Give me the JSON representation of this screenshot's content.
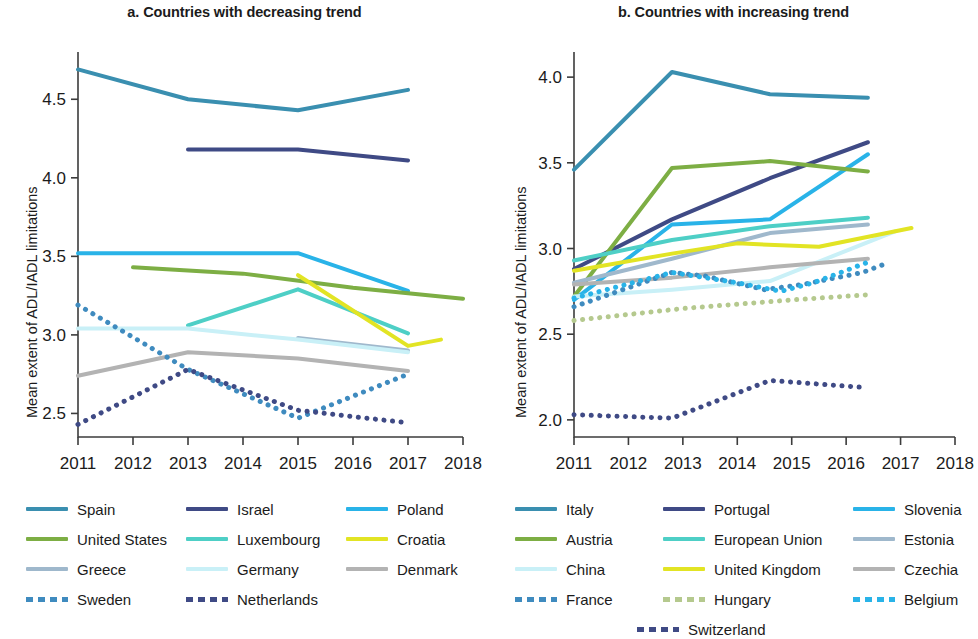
{
  "figure": {
    "ylabel": "Mean extent of ADL/IADL limitations"
  },
  "panels": [
    {
      "id": "a",
      "title": "a. Countries with decreasing trend",
      "xticks": [
        "2011",
        "2012",
        "2013",
        "2014",
        "2015",
        "2016",
        "2017",
        "2018"
      ],
      "yticks": [
        "2.5",
        "3.0",
        "3.5",
        "4.0",
        "4.5"
      ],
      "legend": [
        {
          "label": "Spain",
          "color": "#3a8fb0",
          "style": "solid"
        },
        {
          "label": "Israel",
          "color": "#3f4a85",
          "style": "solid"
        },
        {
          "label": "Poland",
          "color": "#29b3e8",
          "style": "solid"
        },
        {
          "label": "United States",
          "color": "#7dae44",
          "style": "solid"
        },
        {
          "label": "Luxembourg",
          "color": "#4ecfc6",
          "style": "solid"
        },
        {
          "label": "Croatia",
          "color": "#e2e424",
          "style": "solid"
        },
        {
          "label": "Greece",
          "color": "#9fb8cc",
          "style": "solid"
        },
        {
          "label": "Germany",
          "color": "#c9f0f7",
          "style": "solid"
        },
        {
          "label": "Denmark",
          "color": "#b3b3b3",
          "style": "solid"
        },
        {
          "label": "Sweden",
          "color": "#3f8bbf",
          "style": "dotted"
        },
        {
          "label": "Netherlands",
          "color": "#3f4a85",
          "style": "dotted"
        }
      ]
    },
    {
      "id": "b",
      "title": "b. Countries with increasing trend",
      "xticks": [
        "2011",
        "2012",
        "2013",
        "2014",
        "2015",
        "2016",
        "2017",
        "2018"
      ],
      "yticks": [
        "2.0",
        "2.5",
        "3.0",
        "3.5",
        "4.0"
      ],
      "legend": [
        {
          "label": "Italy",
          "color": "#3a8fb0",
          "style": "solid"
        },
        {
          "label": "Portugal",
          "color": "#3f4a85",
          "style": "solid"
        },
        {
          "label": "Slovenia",
          "color": "#29b3e8",
          "style": "solid"
        },
        {
          "label": "Austria",
          "color": "#7dae44",
          "style": "solid"
        },
        {
          "label": "European Union",
          "color": "#4ecfc6",
          "style": "solid"
        },
        {
          "label": "Estonia",
          "color": "#9fb8cc",
          "style": "solid"
        },
        {
          "label": "China",
          "color": "#c9f0f7",
          "style": "solid"
        },
        {
          "label": "United Kingdom",
          "color": "#e2e424",
          "style": "solid"
        },
        {
          "label": "Czechia",
          "color": "#b3b3b3",
          "style": "solid"
        },
        {
          "label": "France",
          "color": "#3f8bbf",
          "style": "dotted"
        },
        {
          "label": "Hungary",
          "color": "#b5c98e",
          "style": "dotted"
        },
        {
          "label": "Belgium",
          "color": "#29b3e8",
          "style": "dotted"
        },
        {
          "label": "Switzerland",
          "color": "#3f4a85",
          "style": "dotted"
        }
      ]
    }
  ],
  "chart_data": [
    {
      "type": "line",
      "title": "a. Countries with decreasing trend",
      "xlabel": "",
      "ylabel": "Mean extent of ADL/IADL limitations",
      "xlim": [
        2011,
        2018
      ],
      "ylim": [
        2.35,
        4.75
      ],
      "yticks": [
        2.5,
        3.0,
        3.5,
        4.0,
        4.5
      ],
      "xticks": [
        2011,
        2012,
        2013,
        2014,
        2015,
        2016,
        2017,
        2018
      ],
      "grid": false,
      "legend_position": "below",
      "series": [
        {
          "name": "Spain",
          "color": "#3a8fb0",
          "style": "solid",
          "points": [
            [
              2011,
              4.69
            ],
            [
              2013,
              4.5
            ],
            [
              2015,
              4.43
            ],
            [
              2017,
              4.56
            ]
          ]
        },
        {
          "name": "Israel",
          "color": "#3f4a85",
          "style": "solid",
          "points": [
            [
              2013,
              4.18
            ],
            [
              2015,
              4.18
            ],
            [
              2017,
              4.11
            ]
          ]
        },
        {
          "name": "Poland",
          "color": "#29b3e8",
          "style": "solid",
          "points": [
            [
              2011,
              3.52
            ],
            [
              2015,
              3.52
            ],
            [
              2017,
              3.28
            ]
          ]
        },
        {
          "name": "United States",
          "color": "#7dae44",
          "style": "solid",
          "points": [
            [
              2012,
              3.43
            ],
            [
              2014,
              3.39
            ],
            [
              2016,
              3.3
            ],
            [
              2018,
              3.23
            ]
          ]
        },
        {
          "name": "Luxembourg",
          "color": "#4ecfc6",
          "style": "solid",
          "points": [
            [
              2013,
              3.06
            ],
            [
              2015,
              3.29
            ],
            [
              2017,
              3.01
            ]
          ]
        },
        {
          "name": "Croatia",
          "color": "#e2e424",
          "style": "solid",
          "points": [
            [
              2015,
              3.38
            ],
            [
              2017,
              2.93
            ],
            [
              2017.6,
              2.97
            ]
          ]
        },
        {
          "name": "Greece",
          "color": "#9fb8cc",
          "style": "solid",
          "points": [
            [
              2015,
              2.98
            ],
            [
              2017,
              2.9
            ]
          ]
        },
        {
          "name": "Germany",
          "color": "#c9f0f7",
          "style": "solid",
          "points": [
            [
              2011,
              3.04
            ],
            [
              2013,
              3.04
            ],
            [
              2015,
              2.97
            ],
            [
              2017,
              2.89
            ]
          ]
        },
        {
          "name": "Denmark",
          "color": "#b3b3b3",
          "style": "solid",
          "points": [
            [
              2011,
              2.74
            ],
            [
              2013,
              2.89
            ],
            [
              2015,
              2.85
            ],
            [
              2017,
              2.77
            ]
          ]
        },
        {
          "name": "Sweden",
          "color": "#3f8bbf",
          "style": "dotted",
          "points": [
            [
              2011,
              3.19
            ],
            [
              2013,
              2.78
            ],
            [
              2015,
              2.47
            ],
            [
              2017,
              2.75
            ]
          ]
        },
        {
          "name": "Netherlands",
          "color": "#3f4a85",
          "style": "dotted",
          "points": [
            [
              2011,
              2.43
            ],
            [
              2013,
              2.78
            ],
            [
              2015,
              2.52
            ],
            [
              2017,
              2.44
            ]
          ]
        }
      ]
    },
    {
      "type": "line",
      "title": "b. Countries with increasing trend",
      "xlabel": "",
      "ylabel": "Mean extent of ADL/IADL limitations",
      "xlim": [
        2011,
        2018
      ],
      "ylim": [
        1.9,
        4.1
      ],
      "yticks": [
        2.0,
        2.5,
        3.0,
        3.5,
        4.0
      ],
      "xticks": [
        2011,
        2012,
        2013,
        2014,
        2015,
        2016,
        2017,
        2018
      ],
      "grid": false,
      "legend_position": "below",
      "series": [
        {
          "name": "Italy",
          "color": "#3a8fb0",
          "style": "solid",
          "points": [
            [
              2011,
              3.46
            ],
            [
              2012.8,
              4.03
            ],
            [
              2014.6,
              3.9
            ],
            [
              2016.4,
              3.88
            ]
          ]
        },
        {
          "name": "Portugal",
          "color": "#3f4a85",
          "style": "solid",
          "points": [
            [
              2011,
              2.88
            ],
            [
              2012.8,
              3.17
            ],
            [
              2014.6,
              3.41
            ],
            [
              2016.4,
              3.62
            ]
          ]
        },
        {
          "name": "Slovenia",
          "color": "#29b3e8",
          "style": "solid",
          "points": [
            [
              2011,
              2.7
            ],
            [
              2012.8,
              3.14
            ],
            [
              2014.6,
              3.17
            ],
            [
              2016.4,
              3.55
            ]
          ]
        },
        {
          "name": "Austria",
          "color": "#7dae44",
          "style": "solid",
          "points": [
            [
              2011,
              2.72
            ],
            [
              2012.8,
              3.47
            ],
            [
              2014.6,
              3.51
            ],
            [
              2016.4,
              3.45
            ]
          ]
        },
        {
          "name": "European Union",
          "color": "#4ecfc6",
          "style": "solid",
          "points": [
            [
              2011,
              2.93
            ],
            [
              2012.8,
              3.05
            ],
            [
              2014.6,
              3.13
            ],
            [
              2016.4,
              3.18
            ]
          ]
        },
        {
          "name": "Estonia",
          "color": "#9fb8cc",
          "style": "solid",
          "points": [
            [
              2011,
              2.8
            ],
            [
              2012.8,
              2.94
            ],
            [
              2014.6,
              3.09
            ],
            [
              2016.4,
              3.14
            ]
          ]
        },
        {
          "name": "China",
          "color": "#c9f0f7",
          "style": "solid",
          "points": [
            [
              2011,
              2.72
            ],
            [
              2012.8,
              2.76
            ],
            [
              2014.6,
              2.81
            ],
            [
              2016.9,
              3.1
            ]
          ]
        },
        {
          "name": "United Kingdom",
          "color": "#e2e424",
          "style": "solid",
          "points": [
            [
              2011,
              2.87
            ],
            [
              2012.8,
              2.97
            ],
            [
              2014.0,
              3.03
            ],
            [
              2015.5,
              3.01
            ],
            [
              2017.2,
              3.12
            ]
          ]
        },
        {
          "name": "Czechia",
          "color": "#b3b3b3",
          "style": "solid",
          "points": [
            [
              2011,
              2.79
            ],
            [
              2012.8,
              2.83
            ],
            [
              2014.6,
              2.89
            ],
            [
              2016.4,
              2.94
            ]
          ]
        },
        {
          "name": "France",
          "color": "#3f8bbf",
          "style": "dotted",
          "points": [
            [
              2011,
              2.66
            ],
            [
              2012.8,
              2.86
            ],
            [
              2013.4,
              2.84
            ],
            [
              2014.5,
              2.76
            ],
            [
              2015.2,
              2.79
            ],
            [
              2016.3,
              2.86
            ],
            [
              2016.8,
              2.92
            ]
          ]
        },
        {
          "name": "Hungary",
          "color": "#b5c98e",
          "style": "dotted",
          "points": [
            [
              2011,
              2.58
            ],
            [
              2013,
              2.65
            ],
            [
              2015,
              2.7
            ],
            [
              2016.4,
              2.73
            ]
          ]
        },
        {
          "name": "Belgium",
          "color": "#29b3e8",
          "style": "dotted",
          "points": [
            [
              2011,
              2.71
            ],
            [
              2012.8,
              2.86
            ],
            [
              2014.0,
              2.8
            ],
            [
              2014.8,
              2.75
            ],
            [
              2015.4,
              2.8
            ],
            [
              2016.4,
              2.92
            ]
          ]
        },
        {
          "name": "Switzerland",
          "color": "#3f4a85",
          "style": "dotted",
          "points": [
            [
              2011,
              2.03
            ],
            [
              2012.8,
              2.01
            ],
            [
              2014.6,
              2.23
            ],
            [
              2016.3,
              2.19
            ]
          ]
        }
      ]
    }
  ]
}
